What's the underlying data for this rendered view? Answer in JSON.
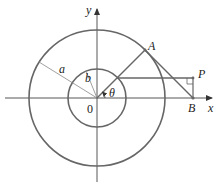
{
  "figure": {
    "title": "",
    "labels": {
      "x_axis": "x",
      "y_axis": "y",
      "origin": "0",
      "point_A": "A",
      "point_B": "B",
      "point_P": "P",
      "outer_radius": "a",
      "inner_radius": "b",
      "angle": "θ"
    },
    "elements": {
      "outer_circle": "circle of radius a centered at origin",
      "inner_circle": "circle of radius b centered at origin",
      "segment_OA": "from origin through inner circle to A on outer circle at angle θ",
      "tangent_AB": "tangent line from A to B on x-axis",
      "horizontal_line": "from inner circle point horizontally to P",
      "vertical_PB": "vertical segment from P down to B",
      "right_angle_mark": "at P"
    },
    "colors": {
      "circle": "#666666",
      "line": "#666666",
      "axis": "#444444",
      "text": "#222222"
    }
  }
}
